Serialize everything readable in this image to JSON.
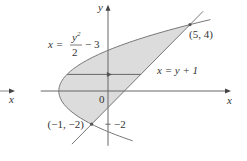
{
  "figure": {
    "type": "region-diagram",
    "curves": [
      {
        "name": "parabola",
        "equation_lhs": "x =",
        "equation_num": "y",
        "equation_num_sup": "2",
        "equation_den": "2",
        "equation_rest": "− 3",
        "y_range": [
          -3,
          4.3
        ]
      },
      {
        "name": "line",
        "equation": "x = y + 1",
        "y_range": [
          -3.2,
          4.8
        ]
      }
    ],
    "intersections": [
      {
        "label": "(5, 4)",
        "x": 5,
        "y": 4
      },
      {
        "label": "(−1, −2)",
        "x": -1,
        "y": -2
      }
    ],
    "axes": {
      "x_label": "x",
      "y_label": "y",
      "origin_label": "0",
      "y_tick_label": "−2",
      "x_range": [
        -4.1,
        7.5
      ],
      "y_range": [
        -3.3,
        5.2
      ]
    },
    "sample_strip": {
      "y": 1
    },
    "side_arrow_label": "x",
    "colors": {
      "fill": "#dcdcdc",
      "stroke": "#777777",
      "axis": "#555555",
      "text": "#333333"
    }
  }
}
